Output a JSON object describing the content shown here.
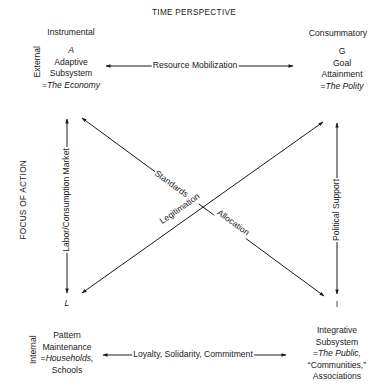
{
  "header": {
    "title": "TIME PERSPECTIVE"
  },
  "axis": {
    "vertical_title": "FOCUS OF ACTION",
    "columns": {
      "left": "Instrumental",
      "right": "Consummatory"
    },
    "rows": {
      "top": "External",
      "bottom": "Internal"
    }
  },
  "quadrants": {
    "A": {
      "letter": "A",
      "line1": "Adaptive",
      "line2": "Subsystem",
      "eq_prefix": "=",
      "eq_value": "The Economy"
    },
    "G": {
      "letter": "G",
      "line1": "Goal",
      "line2": "Attainment",
      "eq_prefix": "=",
      "eq_value": "The Polity"
    },
    "L": {
      "letter": "L",
      "line1": "Pattern",
      "line2": "Maintenance",
      "eq_prefix": "=",
      "eq_value": "Households,",
      "line4": "Schools"
    },
    "I": {
      "letter": "I",
      "line1": "Integrative",
      "line2": "Subsystem",
      "eq_prefix": "=",
      "eq_value": "The Public,",
      "line4": "“Communities,”",
      "line5": "Associations"
    }
  },
  "interchanges": {
    "top": "Resource Mobilization",
    "bottom": "Loyalty, Solidarity, Commitment",
    "left": "Labor/Consumption Market",
    "right": "Political Support",
    "diagonal_upper": "Standards of",
    "diagonal_lower": "Legitimation",
    "diagonal_allocation": "Allocation"
  },
  "colors": {
    "ink": "#1a1a1a",
    "background": "#ffffff"
  }
}
